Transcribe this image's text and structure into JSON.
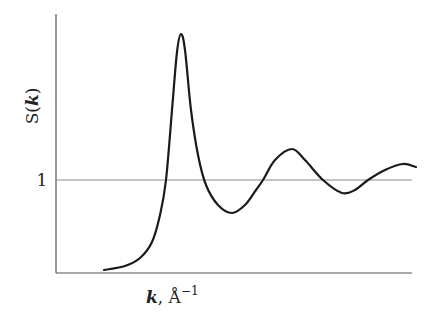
{
  "chart_data": {
    "type": "line",
    "title": "",
    "xlabel": "k, Å⁻¹",
    "ylabel": "S(k)",
    "x_tick_labels": [],
    "y_tick_labels": [
      "1"
    ],
    "reference_line": {
      "y": 1,
      "label": "1"
    },
    "grid": false,
    "legend": null,
    "series": [
      {
        "name": "S(k)",
        "points_px": [
          [
            104,
            270
          ],
          [
            125,
            266
          ],
          [
            140,
            258
          ],
          [
            152,
            242
          ],
          [
            160,
            215
          ],
          [
            166,
            180
          ],
          [
            172,
            110
          ],
          [
            177,
            52
          ],
          [
            181,
            34
          ],
          [
            185,
            50
          ],
          [
            191,
            110
          ],
          [
            198,
            155
          ],
          [
            206,
            185
          ],
          [
            218,
            205
          ],
          [
            232,
            213
          ],
          [
            245,
            205
          ],
          [
            256,
            190
          ],
          [
            263,
            180
          ],
          [
            275,
            160
          ],
          [
            292,
            149
          ],
          [
            305,
            160
          ],
          [
            323,
            180
          ],
          [
            342,
            193
          ],
          [
            355,
            190
          ],
          [
            368,
            180
          ],
          [
            385,
            170
          ],
          [
            403,
            164
          ],
          [
            416,
            167
          ]
        ],
        "relative_values": [
          {
            "k": "low",
            "S": 0.05
          },
          {
            "k": "first_peak",
            "S": 2.0
          },
          {
            "k": "first_min",
            "S": 0.78
          },
          {
            "k": "second_peak",
            "S": 1.2
          },
          {
            "k": "second_min",
            "S": 0.91
          },
          {
            "k": "third_peak",
            "S": 1.1
          }
        ]
      }
    ],
    "ylim_px": {
      "axis_top": 14,
      "axis_bottom": 273,
      "one_level": 180
    },
    "xlim_px": {
      "axis_left": 56,
      "axis_right": 412
    }
  },
  "labels": {
    "y_label_prefix": "S(",
    "y_label_var": "k",
    "y_label_suffix": ")",
    "y_tick_one": "1",
    "x_label_var": "k",
    "x_label_unit": ", Å",
    "x_label_exp": "−1"
  }
}
